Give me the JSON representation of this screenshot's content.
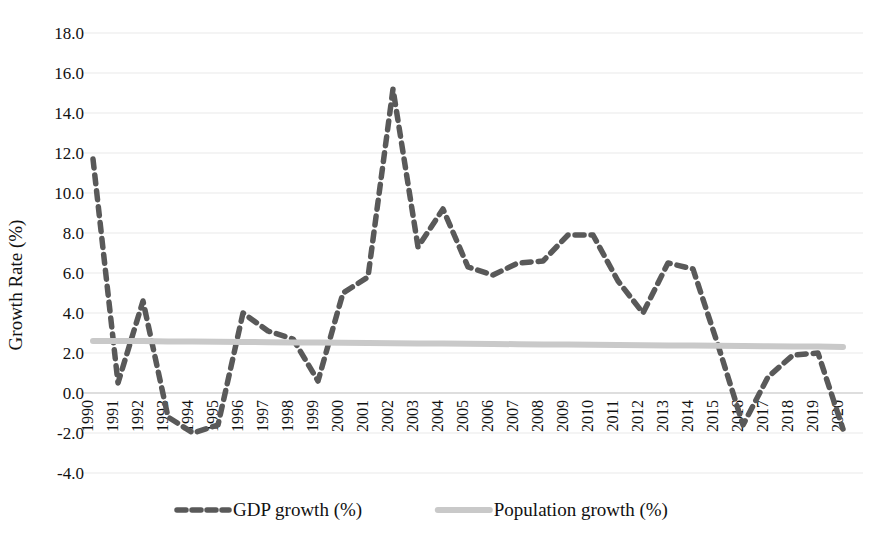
{
  "chart_data": {
    "type": "line",
    "title": "",
    "xlabel": "",
    "ylabel": "Growth Rate (%)",
    "ylim": [
      -4.0,
      18.0
    ],
    "ytick_step": 2.0,
    "yticks": [
      "18.0",
      "16.0",
      "14.0",
      "12.0",
      "10.0",
      "8.0",
      "6.0",
      "4.0",
      "2.0",
      "0.0",
      "-2.0",
      "-4.0"
    ],
    "ytick_values": [
      18.0,
      16.0,
      14.0,
      12.0,
      10.0,
      8.0,
      6.0,
      4.0,
      2.0,
      0.0,
      -2.0,
      -4.0
    ],
    "grid": true,
    "grid_axis": "y",
    "legend_position": "bottom",
    "x": [
      1990,
      1991,
      1992,
      1993,
      1994,
      1995,
      1996,
      1997,
      1998,
      1999,
      2000,
      2001,
      2002,
      2003,
      2004,
      2005,
      2006,
      2007,
      2008,
      2009,
      2010,
      2011,
      2012,
      2013,
      2014,
      2015,
      2016,
      2017,
      2018,
      2019,
      2020
    ],
    "categories": [
      "1990",
      "1991",
      "1992",
      "1993",
      "1994",
      "1995",
      "1996",
      "1997",
      "1998",
      "1999",
      "2000",
      "2001",
      "2002",
      "2003",
      "2004",
      "2005",
      "2006",
      "2007",
      "2008",
      "2009",
      "2010",
      "2011",
      "2012",
      "2013",
      "2014",
      "2015",
      "2016",
      "2017",
      "2018",
      "2019",
      "2020"
    ],
    "series": [
      {
        "name": "GDP growth (%)",
        "color": "#595959",
        "style": "dashed",
        "values": [
          11.7,
          0.5,
          4.6,
          -1.2,
          -2.0,
          -1.6,
          4.0,
          3.1,
          2.7,
          0.6,
          5.0,
          5.8,
          15.2,
          7.3,
          9.2,
          6.3,
          5.9,
          6.5,
          6.6,
          7.9,
          7.9,
          5.6,
          4.0,
          6.5,
          6.2,
          2.4,
          -1.6,
          0.8,
          1.9,
          2.0,
          -1.8
        ]
      },
      {
        "name": "Population growth (%)",
        "color": "#c9c9c9",
        "style": "solid",
        "values": [
          2.6,
          2.6,
          2.6,
          2.58,
          2.57,
          2.56,
          2.55,
          2.54,
          2.53,
          2.52,
          2.51,
          2.5,
          2.49,
          2.48,
          2.47,
          2.46,
          2.45,
          2.44,
          2.43,
          2.42,
          2.41,
          2.4,
          2.39,
          2.38,
          2.37,
          2.36,
          2.35,
          2.34,
          2.33,
          2.32,
          2.3
        ]
      }
    ]
  },
  "legend": {
    "items": [
      {
        "label": "GDP growth (%)",
        "color": "#595959",
        "style": "dashed"
      },
      {
        "label": "Population growth (%)",
        "color": "#c9c9c9",
        "style": "solid"
      }
    ]
  }
}
